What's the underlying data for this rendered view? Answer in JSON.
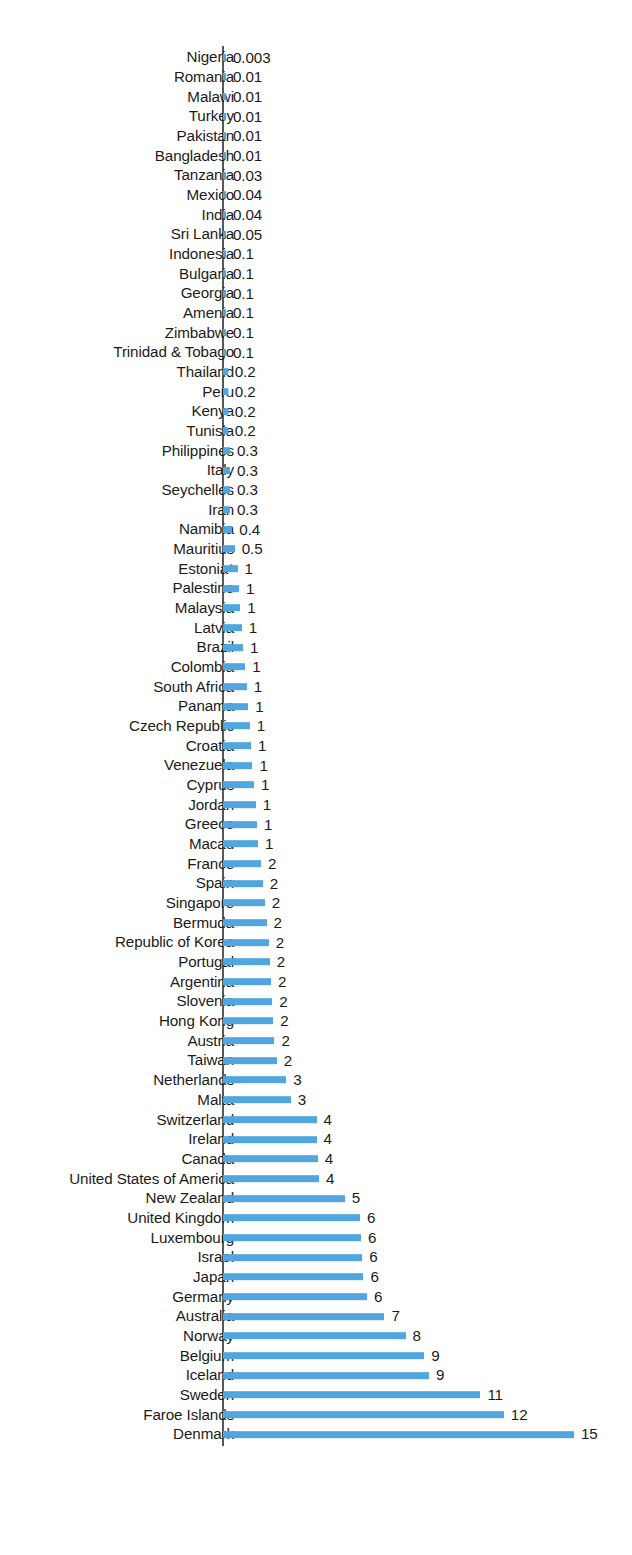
{
  "chart_data": {
    "type": "bar",
    "orientation": "horizontal",
    "title": "",
    "subtitle": "",
    "xlabel": "",
    "ylabel": "",
    "grid": false,
    "legend": null,
    "axis_line_color": "#58585a",
    "bar_color": "#51a5e0",
    "value_label_position": "outside-end",
    "note": "Value labels are rounded; several categories share a rounded label while their bar lengths differ.",
    "xlim": [
      0,
      15
    ],
    "categories": [
      "Nigeria",
      "Romania",
      "Malawi",
      "Turkey",
      "Pakistan",
      "Bangladesh",
      "Tanzania",
      "Mexico",
      "India",
      "Sri Lanka",
      "Indonesia",
      "Bulgaria",
      "Georgia",
      "Amenia",
      "Zimbabwe",
      "Trinidad & Tobago",
      "Thailand",
      "Peru",
      "Kenya",
      "Tunisla",
      "Philippines",
      "Italy",
      "Seychelles",
      "Iran",
      "Namibia",
      "Mauritius",
      "Estonia*",
      "Palestine",
      "Malaysia",
      "Latvia",
      "Brazil",
      "Colombia",
      "South Africa",
      "Panama",
      "Czech Republic",
      "Croatia",
      "Venezuela",
      "Cyprus",
      "Jordan",
      "Greece",
      "Macau",
      "France",
      "Spain",
      "Singapore",
      "Bermuda",
      "Republic of Korea",
      "Portugal",
      "Argentina",
      "Slovenia",
      "Hong Kong",
      "Austria",
      "Taiwan",
      "Netherlands",
      "Malta",
      "Switzerland",
      "Ireland",
      "Canada",
      "United States of America",
      "New Zealand",
      "United Kingdom",
      "Luxembourg",
      "Israel",
      "Japan",
      "Germany",
      "Australia",
      "Norway",
      "Belgium",
      "Iceland",
      "Sweden",
      "Faroe Islands",
      "Denmark"
    ],
    "value_labels": [
      "0.003",
      "0.01",
      "0.01",
      "0.01",
      "0.01",
      "0.01",
      "0.03",
      "0.04",
      "0.04",
      "0.05",
      "0.1",
      "0.1",
      "0.1",
      "0.1",
      "0.1",
      "0.1",
      "0.2",
      "0.2",
      "0.2",
      "0.2",
      "0.3",
      "0.3",
      "0.3",
      "0.3",
      "0.4",
      "0.5",
      "1",
      "1",
      "1",
      "1",
      "1",
      "1",
      "1",
      "1",
      "1",
      "1",
      "1",
      "1",
      "1",
      "1",
      "1",
      "2",
      "2",
      "2",
      "2",
      "2",
      "2",
      "2",
      "2",
      "2",
      "2",
      "2",
      "3",
      "3",
      "4",
      "4",
      "4",
      "4",
      "5",
      "6",
      "6",
      "6",
      "6",
      "6",
      "7",
      "8",
      "9",
      "9",
      "11",
      "12",
      "15"
    ],
    "values": [
      0.003,
      0.01,
      0.01,
      0.01,
      0.01,
      0.01,
      0.03,
      0.04,
      0.04,
      0.05,
      0.1,
      0.1,
      0.1,
      0.1,
      0.1,
      0.1,
      0.2,
      0.2,
      0.2,
      0.2,
      0.3,
      0.3,
      0.3,
      0.3,
      0.4,
      0.5,
      0.62,
      0.68,
      0.74,
      0.8,
      0.86,
      0.95,
      1.02,
      1.08,
      1.14,
      1.2,
      1.26,
      1.32,
      1.4,
      1.45,
      1.5,
      1.62,
      1.7,
      1.78,
      1.86,
      1.95,
      2.0,
      2.05,
      2.1,
      2.15,
      2.2,
      2.3,
      2.7,
      2.9,
      4.0,
      4.0,
      4.05,
      4.1,
      5.2,
      5.85,
      5.9,
      5.95,
      6.0,
      6.15,
      6.9,
      7.8,
      8.6,
      8.8,
      11.0,
      12.0,
      15.0
    ]
  }
}
